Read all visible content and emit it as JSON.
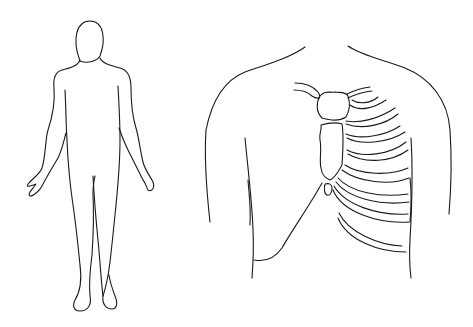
{
  "figures": [
    {
      "id": "body-outline",
      "label": "",
      "description": "Full-body front outline of a human figure"
    },
    {
      "id": "chest-diagram",
      "label": "",
      "description": "Chest/torso outline showing clavicle, sternum and ribs on one side"
    }
  ],
  "colors": {
    "line": "#1a1a1a",
    "background": "#ffffff"
  }
}
